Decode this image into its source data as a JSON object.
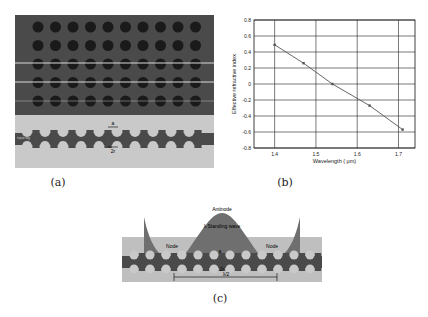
{
  "panels": {
    "a": {
      "caption": "(a)",
      "labels": {
        "top_arrow": "a",
        "bottom_arrow": "2r",
        "left_waveguide": "input wg",
        "right_waveguide": "wg"
      },
      "hole_rows": 5,
      "hole_cols": 10
    },
    "b": {
      "caption": "(b)"
    },
    "c": {
      "caption": "(c)",
      "labels": {
        "antinode": "Antinode",
        "standing_wave": "λ Standing wave",
        "node_left": "Node",
        "node_right": "Node",
        "a": "a",
        "two_r": "2r",
        "half_lambda": "λ/2",
        "left_wg": "input wg",
        "right_wg": "wg"
      }
    }
  },
  "chart_data": {
    "type": "line",
    "title": "",
    "xlabel": "Wavelength ( μm)",
    "ylabel": "Effective refractive index",
    "xlim": [
      1.35,
      1.74
    ],
    "ylim": [
      -0.8,
      0.8
    ],
    "xticks": [
      "1.4",
      "1.5",
      "1.6",
      "1.7"
    ],
    "yticks": [
      "0.8",
      "0.6",
      "0.4",
      "0.2",
      "0",
      "-0.2",
      "-0.4",
      "-0.6",
      "-0.8"
    ],
    "grid": true,
    "series": [
      {
        "name": "n_eff",
        "x": [
          1.4,
          1.47,
          1.54,
          1.63,
          1.71
        ],
        "y": [
          0.49,
          0.26,
          0.0,
          -0.27,
          -0.57
        ],
        "marker": "square",
        "color": "#555555"
      }
    ]
  }
}
